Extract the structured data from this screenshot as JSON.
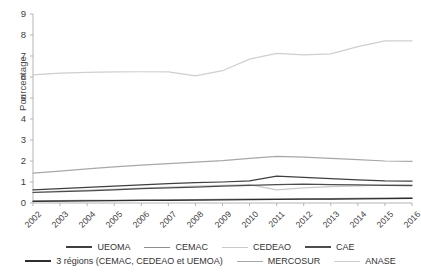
{
  "chart_data": {
    "type": "line",
    "title": "",
    "xlabel": "",
    "ylabel": "Pourcentage",
    "grid": false,
    "legend_position": "bottom",
    "ylim": [
      0,
      9
    ],
    "yticks": [
      0,
      1,
      2,
      3,
      4,
      5,
      6,
      7,
      8,
      9
    ],
    "categories": [
      "2002",
      "2003",
      "2004",
      "2005",
      "2006",
      "2007",
      "2008",
      "2009",
      "2010",
      "2011",
      "2012",
      "2013",
      "2014",
      "2015",
      "2016"
    ],
    "series": [
      {
        "name": "UEOMA",
        "color": "#3f3f3f",
        "values": [
          0.62,
          0.68,
          0.74,
          0.8,
          0.86,
          0.92,
          0.97,
          1.0,
          1.05,
          1.28,
          1.22,
          1.16,
          1.1,
          1.05,
          1.04
        ]
      },
      {
        "name": "CEMAC",
        "color": "#8e8e8e",
        "values": [
          0.1,
          0.11,
          0.12,
          0.13,
          0.14,
          0.15,
          0.16,
          0.17,
          0.18,
          0.19,
          0.2,
          0.21,
          0.22,
          0.23,
          0.24
        ]
      },
      {
        "name": "CEDEAO",
        "color": "#c9c9c9",
        "values": [
          0.52,
          0.56,
          0.61,
          0.66,
          0.71,
          0.76,
          0.8,
          0.84,
          0.88,
          0.62,
          0.72,
          0.78,
          0.82,
          0.86,
          0.88
        ]
      },
      {
        "name": "CAE",
        "color": "#4d4d4d",
        "values": [
          0.5,
          0.54,
          0.58,
          0.63,
          0.68,
          0.72,
          0.76,
          0.8,
          0.84,
          0.88,
          0.9,
          0.88,
          0.86,
          0.84,
          0.83
        ]
      },
      {
        "name": "3 régions (CEMAC, CEDEAO et UEMOA)",
        "color": "#2e2e2e",
        "values": [
          0.08,
          0.09,
          0.1,
          0.11,
          0.12,
          0.13,
          0.14,
          0.15,
          0.16,
          0.17,
          0.18,
          0.19,
          0.2,
          0.21,
          0.22
        ]
      },
      {
        "name": "MERCOSUR",
        "color": "#a8a8a8",
        "values": [
          1.42,
          1.52,
          1.62,
          1.72,
          1.8,
          1.88,
          1.95,
          2.02,
          2.12,
          2.22,
          2.18,
          2.12,
          2.06,
          2.0,
          1.98
        ]
      },
      {
        "name": "ANASE",
        "color": "#cfcfcf",
        "values": [
          6.1,
          6.18,
          6.22,
          6.24,
          6.25,
          6.24,
          6.05,
          6.3,
          6.85,
          7.12,
          7.05,
          7.1,
          7.45,
          7.72,
          7.72
        ]
      }
    ]
  }
}
